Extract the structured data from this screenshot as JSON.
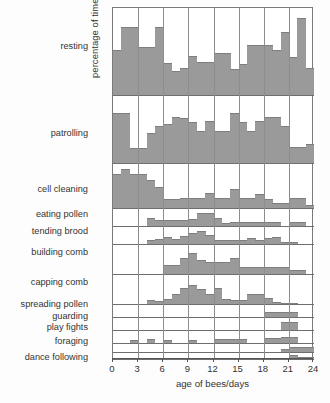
{
  "chart_data": {
    "type": "bar",
    "title": "",
    "subtitle": "",
    "xlabel": "age of bees/days",
    "ylabel": "percentage of time spent in each occupation",
    "xlim": [
      0,
      24
    ],
    "xticks": [
      0,
      3,
      6,
      9,
      12,
      15,
      18,
      21,
      24
    ],
    "xtick_labels": [
      "0",
      "3",
      "6",
      "9",
      "12",
      "15",
      "18",
      "21",
      "24"
    ],
    "grid": "vertical gridlines at every 3 days; horizontal separator lines between stacked panels",
    "legend": "none",
    "bin_width_days": 1,
    "x": [
      0,
      1,
      2,
      3,
      4,
      5,
      6,
      7,
      8,
      9,
      10,
      11,
      12,
      13,
      14,
      15,
      16,
      17,
      18,
      19,
      20,
      21,
      22,
      23
    ],
    "bar_color": "#9a9a9a",
    "bar_edge_color": "#7e7e7e",
    "axis_color": "#7a7a7a",
    "note": "Each stacked panel is a separate occupation; bar heights are percentage of time spent in that occupation, each panel has its own vertical scale.",
    "series": [
      {
        "name": "resting",
        "panel_max_pct": 100,
        "values": [
          52,
          78,
          78,
          55,
          55,
          78,
          37,
          28,
          31,
          45,
          38,
          38,
          48,
          48,
          30,
          36,
          57,
          57,
          57,
          52,
          72,
          44,
          88,
          31
        ]
      },
      {
        "name": "patrolling",
        "panel_max_pct": 100,
        "values": [
          74,
          74,
          22,
          22,
          44,
          55,
          57,
          67,
          66,
          60,
          47,
          62,
          47,
          47,
          73,
          60,
          47,
          62,
          68,
          68,
          55,
          24,
          24,
          28
        ]
      },
      {
        "name": "cell cleaning",
        "panel_max_pct": 60,
        "values": [
          45,
          52,
          45,
          45,
          38,
          28,
          12,
          12,
          13,
          13,
          13,
          20,
          13,
          13,
          26,
          13,
          13,
          19,
          12,
          7,
          7,
          13,
          13,
          4
        ]
      },
      {
        "name": "eating pollen",
        "panel_max_pct": 20,
        "values": [
          0,
          0,
          0,
          0,
          9,
          7,
          7,
          7,
          7,
          8,
          14,
          14,
          9,
          3,
          4,
          5,
          5,
          5,
          5,
          4,
          0,
          5,
          5,
          0
        ]
      },
      {
        "name": "tending brood",
        "panel_max_pct": 20,
        "values": [
          0,
          0,
          0,
          0,
          5,
          6,
          8,
          6,
          9,
          12,
          15,
          10,
          5,
          5,
          5,
          5,
          7,
          5,
          7,
          8,
          2,
          2,
          0,
          0
        ]
      },
      {
        "name": "building comb",
        "panel_max_pct": 40,
        "values": [
          0,
          0,
          0,
          0,
          0,
          0,
          12,
          12,
          22,
          28,
          19,
          16,
          16,
          16,
          22,
          9,
          9,
          9,
          9,
          9,
          9,
          6,
          6,
          0
        ]
      },
      {
        "name": "capping comb",
        "panel_max_pct": 40,
        "values": [
          0,
          0,
          0,
          0,
          6,
          4,
          7,
          14,
          22,
          26,
          20,
          14,
          22,
          7,
          6,
          6,
          13,
          13,
          8,
          3,
          2,
          2,
          0,
          0
        ]
      },
      {
        "name": "spreading pollen",
        "panel_max_pct": 10,
        "values": [
          0,
          0,
          0,
          0,
          0,
          0,
          0,
          0,
          0,
          0,
          0,
          0,
          0,
          0,
          0,
          0,
          0,
          0,
          4,
          4,
          4,
          4,
          0,
          0
        ]
      },
      {
        "name": "guarding",
        "panel_max_pct": 10,
        "values": [
          0,
          0,
          0,
          0,
          0,
          0,
          0,
          0,
          0,
          0,
          0,
          0,
          0,
          0,
          0,
          0,
          0,
          0,
          0,
          0,
          6,
          6,
          0,
          0
        ]
      },
      {
        "name": "play fights",
        "panel_max_pct": 10,
        "values": [
          0,
          0,
          2,
          0,
          3,
          0,
          2,
          0,
          0,
          2,
          0,
          0,
          3,
          3,
          3,
          3,
          0,
          0,
          4,
          4,
          5,
          5,
          0,
          0
        ]
      },
      {
        "name": "foraging",
        "panel_max_pct": 100,
        "values": [
          0,
          0,
          0,
          0,
          0,
          0,
          0,
          0,
          0,
          0,
          0,
          0,
          0,
          0,
          0,
          0,
          0,
          0,
          0,
          0,
          32,
          60,
          60,
          60
        ]
      },
      {
        "name": "dance following",
        "panel_max_pct": 40,
        "values": [
          0,
          0,
          0,
          0,
          0,
          0,
          0,
          0,
          0,
          0,
          0,
          0,
          0,
          0,
          0,
          0,
          0,
          0,
          0,
          8,
          8,
          22,
          12,
          10
        ]
      }
    ]
  },
  "row_labels": [
    {
      "label": "resting",
      "top": 41
    },
    {
      "label": "patrolling",
      "top": 128
    },
    {
      "label": "cell cleaning",
      "top": 184
    },
    {
      "label": "eating pollen",
      "top": 209
    },
    {
      "label": "tending brood",
      "top": 226
    },
    {
      "label": "building comb",
      "top": 247
    },
    {
      "label": "capping comb",
      "top": 277
    },
    {
      "label": "spreading pollen",
      "top": 299
    },
    {
      "label": "guarding",
      "top": 311
    },
    {
      "label": "play fights",
      "top": 322
    },
    {
      "label": "foraging",
      "top": 336
    },
    {
      "label": "dance following",
      "top": 352
    }
  ],
  "panel_layout": [
    {
      "name": "resting",
      "top": 0,
      "height": 87
    },
    {
      "name": "patrolling",
      "top": 87,
      "height": 68
    },
    {
      "name": "cell cleaning",
      "top": 155,
      "height": 45
    },
    {
      "name": "eating pollen",
      "top": 200,
      "height": 18
    },
    {
      "name": "tending brood",
      "top": 218,
      "height": 18
    },
    {
      "name": "building comb",
      "top": 236,
      "height": 30
    },
    {
      "name": "capping comb",
      "top": 266,
      "height": 30
    },
    {
      "name": "spreading pollen",
      "top": 296,
      "height": 13
    },
    {
      "name": "guarding",
      "top": 309,
      "height": 13
    },
    {
      "name": "play fights",
      "top": 322,
      "height": 13
    },
    {
      "name": "foraging",
      "top": 335,
      "height": 9
    },
    {
      "name": "dance following",
      "top": 344,
      "height": 7
    }
  ]
}
